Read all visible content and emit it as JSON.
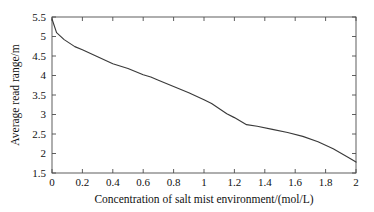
{
  "chart_data": {
    "type": "line",
    "title": "",
    "xlabel": "Concentration of salt mist environment/(mol/L)",
    "ylabel": "Average read range/m",
    "xlim": [
      0,
      2
    ],
    "ylim": [
      1.5,
      5.5
    ],
    "grid": false,
    "legend": null,
    "xticks": [
      0,
      0.2,
      0.4,
      0.6,
      0.8,
      1,
      1.2,
      1.4,
      1.6,
      1.8,
      2
    ],
    "xticklabels": [
      "0",
      "0.2",
      "0.4",
      "0.6",
      "0.8",
      "1",
      "1.2",
      "1.4",
      "1.6",
      "1.8",
      "2"
    ],
    "yticks": [
      1.5,
      2,
      2.5,
      3,
      3.5,
      4,
      4.5,
      5,
      5.5
    ],
    "yticklabels": [
      "1.5",
      "2",
      "2.5",
      "3",
      "3.5",
      "4",
      "4.5",
      "5",
      "5.5"
    ],
    "series": [
      {
        "name": "Average read range",
        "color": "#3a3a3a",
        "x": [
          0,
          0.03,
          0.08,
          0.15,
          0.2,
          0.3,
          0.4,
          0.5,
          0.6,
          0.65,
          0.7,
          0.8,
          0.9,
          1.0,
          1.05,
          1.15,
          1.2,
          1.28,
          1.35,
          1.45,
          1.55,
          1.65,
          1.75,
          1.85,
          1.95,
          2.0
        ],
        "y": [
          5.45,
          5.1,
          4.92,
          4.74,
          4.66,
          4.48,
          4.3,
          4.18,
          4.02,
          3.96,
          3.88,
          3.72,
          3.56,
          3.38,
          3.28,
          3.02,
          2.92,
          2.74,
          2.7,
          2.62,
          2.54,
          2.44,
          2.3,
          2.12,
          1.9,
          1.78
        ]
      }
    ]
  },
  "axis": {
    "x_title": "Concentration of salt mist environment/(mol/L)",
    "y_title": "Average read range/m"
  }
}
